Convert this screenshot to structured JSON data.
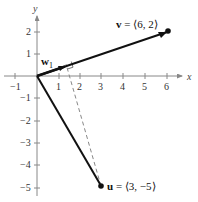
{
  "diagram": {
    "type": "vector-projection",
    "axes": {
      "x_label": "x",
      "y_label": "y",
      "x_ticks": [
        "−1",
        "1",
        "2",
        "3",
        "4",
        "5",
        "6"
      ],
      "y_ticks": [
        "2",
        "1",
        "−1",
        "−2",
        "−3",
        "−4",
        "−5"
      ]
    },
    "vectors": {
      "v": {
        "name": "v",
        "eq": " = ⟨6, 2⟩",
        "x": 6,
        "y": 2
      },
      "u": {
        "name": "u",
        "eq": " = ⟨3, −5⟩",
        "x": 3,
        "y": -5
      },
      "w1": {
        "name": "w",
        "subscript": "1"
      }
    },
    "colors": {
      "vector": "#111111",
      "axis": "#777777",
      "dashed": "#888888"
    }
  }
}
